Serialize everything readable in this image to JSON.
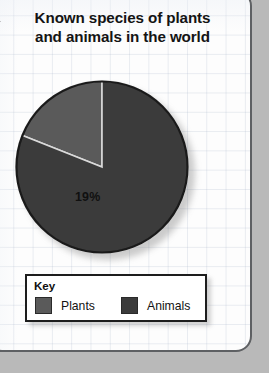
{
  "title": "Known species of plants and animals in the world",
  "title_lines": [
    "Known species of plants",
    "and animals in the world"
  ],
  "key": {
    "heading": "Key",
    "entries": [
      {
        "label": "Plants",
        "color": "#5a5a5a"
      },
      {
        "label": "Animals",
        "color": "#3b3b3b"
      }
    ]
  },
  "colors": {
    "plants": "#5a5a5a",
    "animals": "#3b3b3b",
    "pie_outline": "#1a1a1a",
    "slice_divider": "#d9d9d9",
    "page_background": "#b9b9b9",
    "card_background": "#fdfdfd",
    "card_border": "#5e6063",
    "text": "#141414"
  },
  "chart_data": {
    "type": "pie",
    "title": "Known species of plants and animals in the world",
    "xlabel": "",
    "ylabel": "",
    "legend_position": "bottom",
    "grid": false,
    "start_angle_deg": 0,
    "direction": "counterclockwise",
    "labels": [
      "Plants",
      "Animals"
    ],
    "values": [
      19,
      81
    ],
    "unit": "%",
    "data_labels": [
      "19%",
      "81%"
    ],
    "slices": [
      {
        "label": "Plants",
        "value": 19,
        "data_label": "19%",
        "color": "#5a5a5a"
      },
      {
        "label": "Animals",
        "value": 81,
        "data_label": "81%",
        "color": "#3b3b3b"
      }
    ]
  }
}
